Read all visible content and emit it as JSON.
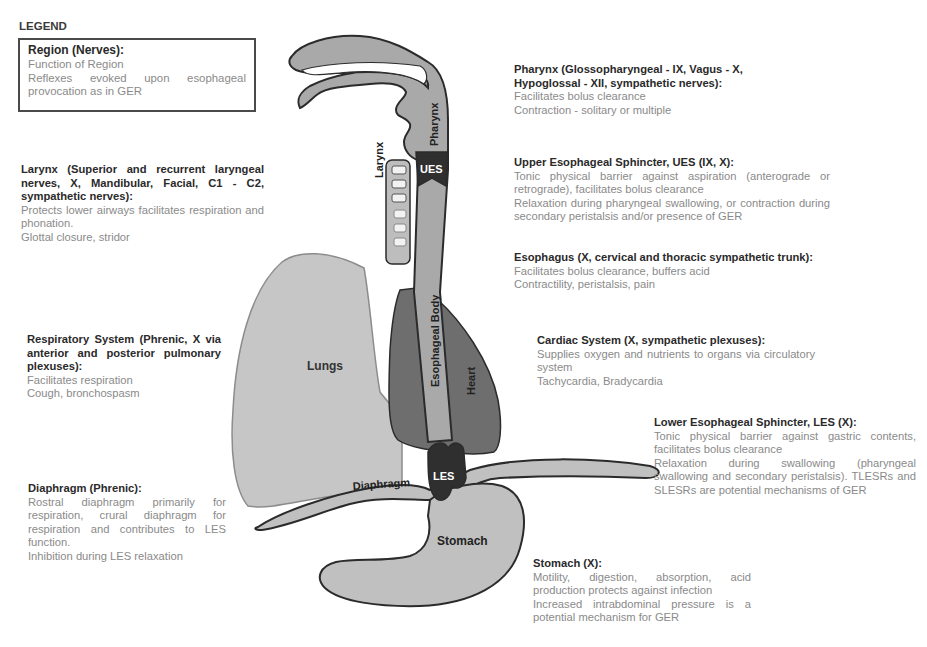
{
  "legend": {
    "heading": "LEGEND",
    "title": "Region (Nerves):",
    "lines": [
      "Function of Region",
      "Reflexes evoked upon esophageal provocation as in GER"
    ]
  },
  "regions": {
    "larynx": {
      "title": "Larynx (Superior and recurrent laryngeal nerves, X, Mandibular, Facial, C1 - C2, sympathetic nerves):",
      "function": "Protects lower airways facilitates respiration and phonation.",
      "reflex": "Glottal closure, stridor"
    },
    "respiratory": {
      "title": "Respiratory System (Phrenic, X via anterior and posterior pulmonary plexuses):",
      "function": "Facilitates respiration",
      "reflex": "Cough, bronchospasm"
    },
    "diaphragm": {
      "title": "Diaphragm (Phrenic):",
      "function": "Rostral diaphragm primarily for respiration, crural diaphragm for respiration and contributes to LES function.",
      "reflex": "Inhibition during LES relaxation"
    },
    "pharynx": {
      "title": "Pharynx (Glossopharyngeal - IX, Vagus - X, Hypoglossal - XII, sympathetic nerves):",
      "function": "Facilitates bolus clearance",
      "reflex": "Contraction - solitary or multiple"
    },
    "ues": {
      "title": "Upper Esophageal Sphincter, UES (IX, X):",
      "function": "Tonic physical barrier against aspiration (anterograde or retrograde), facilitates bolus clearance",
      "reflex": "Relaxation during pharyngeal swallowing, or contraction during secondary peristalsis and/or presence of GER"
    },
    "esophagus": {
      "title": "Esophagus (X, cervical and thoracic sympathetic trunk):",
      "function": "Facilitates bolus clearance, buffers acid",
      "reflex": "Contractility, peristalsis, pain"
    },
    "cardiac": {
      "title": "Cardiac System (X, sympathetic plexuses):",
      "function": "Supplies oxygen and nutrients to organs via circulatory system",
      "reflex": "Tachycardia, Bradycardia"
    },
    "les": {
      "title": "Lower Esophageal Sphincter, LES (X):",
      "function": "Tonic physical barrier against gastric contents, facilitates bolus clearance",
      "reflex": "Relaxation during swallowing (pharyngeal swallowing and secondary peristalsis). TLESRs and SLESRs are potential mechanisms of GER"
    },
    "stomach": {
      "title": "Stomach (X):",
      "function": "Motility, digestion, absorption, acid production protects against infection",
      "reflex": "Increased intrabdominal pressure is a potential mechanism for GER"
    }
  },
  "diagram_labels": {
    "pharynx": "Pharynx",
    "larynx": "Larynx",
    "ues": "UES",
    "esophageal_body": "Esophageal Body",
    "lungs": "Lungs",
    "heart": "Heart",
    "les": "LES",
    "diaphragm": "Diaphragm",
    "stomach": "Stomach"
  },
  "colors": {
    "outline": "#2b2b2b",
    "tissue": "#a9a9a9",
    "lungs": "#c6c6c6",
    "heart": "#6e6e6e",
    "sphincter": "#2f2f2f",
    "title_text": "#2a2a2a",
    "desc_text": "#8a8a8a"
  }
}
